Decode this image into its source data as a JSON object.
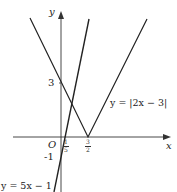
{
  "diagram": {
    "type": "function-graph",
    "axes": {
      "x_label": "x",
      "y_label": "y",
      "origin_label": "O"
    },
    "ticks": {
      "y_three": "3",
      "y_minus_one": "-1",
      "x_one_fifth": {
        "num": "1",
        "den": "5"
      },
      "x_three_halves": {
        "num": "3",
        "den": "2"
      }
    },
    "curves": [
      {
        "label": "y = |2x − 3|",
        "expression": "|2x-3|",
        "vertex": [
          1.5,
          0
        ]
      },
      {
        "label": "y = 5x − 1",
        "expression": "5x-1"
      }
    ],
    "colors": {
      "line": "#222222",
      "axis": "#333333",
      "background": "#ffffff"
    }
  }
}
